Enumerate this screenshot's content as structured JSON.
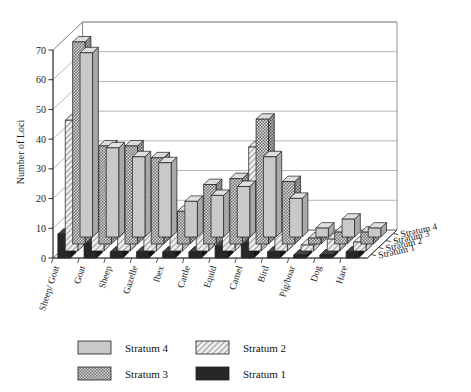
{
  "chart_data": {
    "type": "bar",
    "title": "",
    "xlabel": "",
    "ylabel": "Number of Loci",
    "ylim": [
      0,
      70
    ],
    "yticks": [
      0,
      10,
      20,
      30,
      40,
      50,
      60,
      70
    ],
    "grid": true,
    "projection": "3d-grouped",
    "legend_position": "bottom",
    "depth_axis_labels": [
      "Stratum 4",
      "Stratum 3",
      "Stratum 2",
      "Stratum 1"
    ],
    "categories": [
      "Sheep/ Goat",
      "Goat",
      "Sheep",
      "Gazelle",
      "Ibex",
      "Cattle",
      "Equid",
      "Camel",
      "Bird",
      "Pig/boar",
      "Dog",
      "Hare"
    ],
    "series": [
      {
        "name": "Stratum 4",
        "color": "#c8c8c8",
        "pattern": "solid-gray",
        "values": [
          62,
          30,
          27,
          25,
          12,
          14,
          17,
          27,
          13,
          3,
          6,
          3
        ]
      },
      {
        "name": "Stratum 3",
        "color": "#b4b4b4",
        "pattern": "checker",
        "values": [
          68,
          33,
          33,
          29,
          11,
          20,
          22,
          42,
          21,
          2,
          4,
          4
        ]
      },
      {
        "name": "Stratum 2",
        "color": "#e3e3e3",
        "pattern": "diagonal-hatch",
        "values": [
          44,
          30,
          24,
          18,
          11,
          12,
          14,
          35,
          15,
          2,
          4,
          3
        ]
      },
      {
        "name": "Stratum 1",
        "color": "#272727",
        "pattern": "solid-black",
        "values": [
          8,
          5,
          2,
          2,
          2,
          2,
          4,
          5,
          2,
          1,
          1,
          2
        ]
      }
    ]
  },
  "legend": {
    "entries": [
      {
        "label": "Stratum 4",
        "pattern": "solid-gray"
      },
      {
        "label": "Stratum 2",
        "pattern": "diagonal-hatch"
      },
      {
        "label": "Stratum 3",
        "pattern": "checker"
      },
      {
        "label": "Stratum 1",
        "pattern": "solid-black"
      }
    ]
  },
  "axis": {
    "y_title": "Number of Loci",
    "y_ticks": [
      "0",
      "10",
      "20",
      "30",
      "40",
      "50",
      "60",
      "70"
    ]
  }
}
